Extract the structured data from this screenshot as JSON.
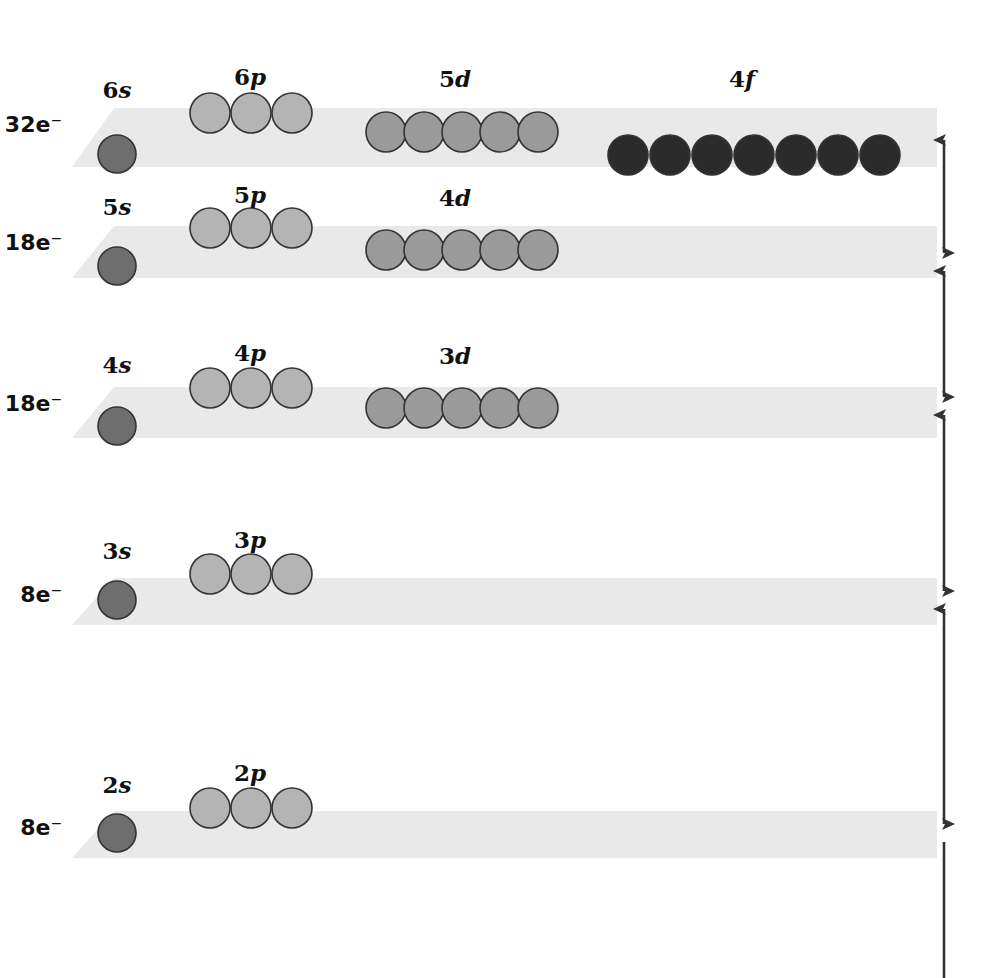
{
  "figure": {
    "background_color": "#ffffff",
    "band_color": "#e9e9e9",
    "axis_color": "#333333",
    "text_color": "#111111"
  },
  "orbital_colors": {
    "s": "#6e6e6e",
    "p": "#b4b4b4",
    "d": "#9a9a9a",
    "f": "#2b2b2b",
    "outline": "#333333"
  },
  "axis": {
    "name": "energy-axis",
    "orientation": "vertical",
    "x": 944,
    "top": 131,
    "bottom": 978,
    "segment_breaks": [
      131,
      262,
      406,
      600,
      833
    ],
    "double_headed": true
  },
  "shells": [
    {
      "id": "shell-6",
      "electron_capacity_label": "32e⁻",
      "band": {
        "top": 108,
        "bottom": 167,
        "left": 72,
        "right": 937,
        "slant": 42
      },
      "subshells": [
        {
          "id": "6s",
          "type": "s",
          "label_prefix": "6",
          "label_letter": "s",
          "label_x": 117,
          "label_y": 98,
          "orbital_count": 1,
          "radius": 19,
          "cy": 154,
          "start_x": 117,
          "spacing": 42
        },
        {
          "id": "6p",
          "type": "p",
          "label_prefix": "6",
          "label_letter": "p",
          "label_x": 250,
          "label_y": 85,
          "orbital_count": 3,
          "radius": 20,
          "cy": 113,
          "start_x": 210,
          "spacing": 41
        },
        {
          "id": "5d",
          "type": "d",
          "label_prefix": "5",
          "label_letter": "d",
          "label_x": 455,
          "label_y": 87,
          "orbital_count": 5,
          "radius": 20,
          "cy": 132,
          "start_x": 386,
          "spacing": 38
        },
        {
          "id": "4f",
          "type": "f",
          "label_prefix": "4",
          "label_letter": "f",
          "label_x": 742,
          "label_y": 87,
          "orbital_count": 7,
          "radius": 20,
          "cy": 155,
          "start_x": 628,
          "spacing": 42
        }
      ]
    },
    {
      "id": "shell-5",
      "electron_capacity_label": "18e⁻",
      "band": {
        "top": 226,
        "bottom": 278,
        "left": 72,
        "right": 937,
        "slant": 42
      },
      "subshells": [
        {
          "id": "5s",
          "type": "s",
          "label_prefix": "5",
          "label_letter": "s",
          "label_x": 117,
          "label_y": 215,
          "orbital_count": 1,
          "radius": 19,
          "cy": 266,
          "start_x": 117,
          "spacing": 42
        },
        {
          "id": "5p",
          "type": "p",
          "label_prefix": "5",
          "label_letter": "p",
          "label_x": 250,
          "label_y": 203,
          "orbital_count": 3,
          "radius": 20,
          "cy": 228,
          "start_x": 210,
          "spacing": 41
        },
        {
          "id": "4d",
          "type": "d",
          "label_prefix": "4",
          "label_letter": "d",
          "label_x": 455,
          "label_y": 206,
          "orbital_count": 5,
          "radius": 20,
          "cy": 250,
          "start_x": 386,
          "spacing": 38
        }
      ]
    },
    {
      "id": "shell-4",
      "electron_capacity_label": "18e⁻",
      "band": {
        "top": 387,
        "bottom": 438,
        "left": 72,
        "right": 937,
        "slant": 42
      },
      "subshells": [
        {
          "id": "4s",
          "type": "s",
          "label_prefix": "4",
          "label_letter": "s",
          "label_x": 117,
          "label_y": 373,
          "orbital_count": 1,
          "radius": 19,
          "cy": 426,
          "start_x": 117,
          "spacing": 42
        },
        {
          "id": "4p",
          "type": "p",
          "label_prefix": "4",
          "label_letter": "p",
          "label_x": 250,
          "label_y": 361,
          "orbital_count": 3,
          "radius": 20,
          "cy": 388,
          "start_x": 210,
          "spacing": 41
        },
        {
          "id": "3d",
          "type": "d",
          "label_prefix": "3",
          "label_letter": "d",
          "label_x": 455,
          "label_y": 364,
          "orbital_count": 5,
          "radius": 20,
          "cy": 408,
          "start_x": 386,
          "spacing": 38
        }
      ]
    },
    {
      "id": "shell-3",
      "electron_capacity_label": "8e⁻",
      "band": {
        "top": 578,
        "bottom": 625,
        "left": 72,
        "right": 937,
        "slant": 42
      },
      "subshells": [
        {
          "id": "3s",
          "type": "s",
          "label_prefix": "3",
          "label_letter": "s",
          "label_x": 117,
          "label_y": 559,
          "orbital_count": 1,
          "radius": 19,
          "cy": 600,
          "start_x": 117,
          "spacing": 42
        },
        {
          "id": "3p",
          "type": "p",
          "label_prefix": "3",
          "label_letter": "p",
          "label_x": 250,
          "label_y": 548,
          "orbital_count": 3,
          "radius": 20,
          "cy": 574,
          "start_x": 210,
          "spacing": 41
        }
      ]
    },
    {
      "id": "shell-2",
      "electron_capacity_label": "8e⁻",
      "band": {
        "top": 811,
        "bottom": 858,
        "left": 72,
        "right": 937,
        "slant": 42
      },
      "subshells": [
        {
          "id": "2s",
          "type": "s",
          "label_prefix": "2",
          "label_letter": "s",
          "label_x": 117,
          "label_y": 793,
          "orbital_count": 1,
          "radius": 19,
          "cy": 833,
          "start_x": 117,
          "spacing": 42
        },
        {
          "id": "2p",
          "type": "p",
          "label_prefix": "2",
          "label_letter": "p",
          "label_x": 250,
          "label_y": 781,
          "orbital_count": 3,
          "radius": 20,
          "cy": 808,
          "start_x": 210,
          "spacing": 41
        }
      ]
    }
  ],
  "electron_label_x": 62,
  "chart_data": {
    "type": "diagram",
    "shell_capacities": [
      {
        "shell": 6,
        "label": "32e⁻",
        "subshells": [
          "6s",
          "6p",
          "5d",
          "4f"
        ],
        "orbital_counts": [
          1,
          3,
          5,
          7
        ]
      },
      {
        "shell": 5,
        "label": "18e⁻",
        "subshells": [
          "5s",
          "5p",
          "4d"
        ],
        "orbital_counts": [
          1,
          3,
          5
        ]
      },
      {
        "shell": 4,
        "label": "18e⁻",
        "subshells": [
          "4s",
          "4p",
          "3d"
        ],
        "orbital_counts": [
          1,
          3,
          5
        ]
      },
      {
        "shell": 3,
        "label": "8e⁻",
        "subshells": [
          "3s",
          "3p"
        ],
        "orbital_counts": [
          1,
          3
        ]
      },
      {
        "shell": 2,
        "label": "8e⁻",
        "subshells": [
          "2s",
          "2p"
        ],
        "orbital_counts": [
          1,
          3
        ]
      }
    ],
    "ylabel": "Increasing energy",
    "legend": [
      {
        "name": "s orbital",
        "color": "#6e6e6e"
      },
      {
        "name": "p orbital",
        "color": "#b4b4b4"
      },
      {
        "name": "d orbital",
        "color": "#9a9a9a"
      },
      {
        "name": "f orbital",
        "color": "#2b2b2b"
      }
    ]
  }
}
